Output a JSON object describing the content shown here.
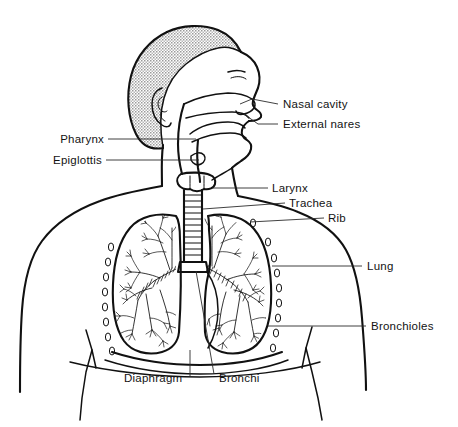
{
  "figure": {
    "view": "head in right-facing profile, thorax frontal",
    "background_color": "#ffffff",
    "ink_color": "#111111",
    "hair_fill_color": "#c9c9c9",
    "leader_color": "#2b2b2b"
  },
  "labels": [
    {
      "id": "nasal-cavity",
      "text": "Nasal cavity",
      "text_x": 283,
      "text_y": 108,
      "anchor": "start",
      "leader": "M 278 104 L 252 99 L 240 104",
      "side": "right"
    },
    {
      "id": "external-nares",
      "text": "External nares",
      "text_x": 283,
      "text_y": 128,
      "anchor": "start",
      "leader": "M 278 124 L 258 124 L 244 114",
      "side": "right"
    },
    {
      "id": "pharynx",
      "text": "Pharynx",
      "text_x": 104,
      "text_y": 143,
      "anchor": "end",
      "leader": "M 108 139 L 196 139",
      "side": "left"
    },
    {
      "id": "epiglottis",
      "text": "Epiglottis",
      "text_x": 104,
      "text_y": 164,
      "anchor": "end",
      "leader": "M 106 160 L 199 160",
      "side": "left"
    },
    {
      "id": "larynx",
      "text": "Larynx",
      "text_x": 272,
      "text_y": 192,
      "anchor": "start",
      "leader": "M 268 188 L 213 188",
      "side": "right"
    },
    {
      "id": "trachea",
      "text": "Trachea",
      "text_x": 289,
      "text_y": 207,
      "anchor": "start",
      "leader": "M 285 203 L 203 209",
      "side": "right"
    },
    {
      "id": "rib",
      "text": "Rib",
      "text_x": 328,
      "text_y": 222,
      "anchor": "start",
      "leader": "M 324 218 L 248 222",
      "side": "right"
    },
    {
      "id": "lung",
      "text": "Lung",
      "text_x": 367,
      "text_y": 270,
      "anchor": "start",
      "leader": "M 362 266 L 272 266",
      "side": "right"
    },
    {
      "id": "bronchioles",
      "text": "Bronchioles",
      "text_x": 371,
      "text_y": 330,
      "anchor": "start",
      "leader": "M 366 326 L 270 326",
      "side": "right"
    },
    {
      "id": "diaphragm",
      "text": "Diaphragm",
      "text_x": 124,
      "text_y": 382,
      "anchor": "start",
      "leader": "M 190 376 L 190 350",
      "side": "bottom"
    },
    {
      "id": "bronchi",
      "text": "Bronchi",
      "text_x": 219,
      "text_y": 382,
      "anchor": "start",
      "leader": "M 214 374 L 196 271",
      "side": "bottom"
    }
  ],
  "structures": [
    {
      "id": "head-profile",
      "name": "Head in profile facing right"
    },
    {
      "id": "hair-region",
      "name": "Stippled hair region"
    },
    {
      "id": "ear",
      "name": "Ear"
    },
    {
      "id": "eye",
      "name": "Eye"
    },
    {
      "id": "nose",
      "name": "Nose"
    },
    {
      "id": "nasal-cavity-structure",
      "name": "Nasal cavity"
    },
    {
      "id": "oral-cavity-tongue",
      "name": "Oral cavity and tongue"
    },
    {
      "id": "pharynx-structure",
      "name": "Pharynx passage"
    },
    {
      "id": "epiglottis-structure",
      "name": "Epiglottis flap"
    },
    {
      "id": "larynx-structure",
      "name": "Larynx"
    },
    {
      "id": "trachea-structure",
      "name": "Trachea with cartilage rings"
    },
    {
      "id": "left-lung",
      "name": "Left lung (viewer left)"
    },
    {
      "id": "right-lung",
      "name": "Right lung (viewer right)"
    },
    {
      "id": "bronchial-tree-left",
      "name": "Left bronchial tree"
    },
    {
      "id": "bronchial-tree-right",
      "name": "Right bronchial tree"
    },
    {
      "id": "primary-bronchi",
      "name": "Primary bronchi with rings"
    },
    {
      "id": "rib-markers",
      "name": "Rib oval markers"
    },
    {
      "id": "diaphragm-structure",
      "name": "Diaphragm curve"
    },
    {
      "id": "torso-outline",
      "name": "Torso, shoulders and arms outline"
    }
  ]
}
